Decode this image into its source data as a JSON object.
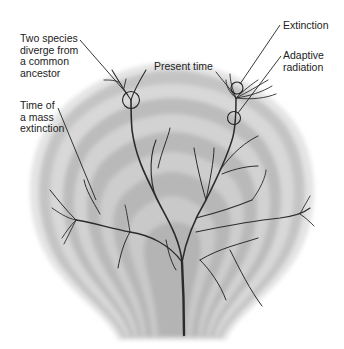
{
  "diagram": {
    "type": "branching phylogenetic tree over concentric time rings",
    "labels": {
      "two_species": "Two species\ndiverge from\na common\nancestor",
      "mass_extinction": "Time of\na mass\nextinction",
      "present_time": "Present time",
      "extinction": "Extinction",
      "adaptive_radiation": "Adaptive\nradiation"
    },
    "colors": {
      "background": "#ffffff",
      "ring_light": "#d6d6d6",
      "ring_dark": "#b8b8b8",
      "branch": "#2b2b2b",
      "leader_line": "#222222",
      "text": "#222222"
    }
  }
}
